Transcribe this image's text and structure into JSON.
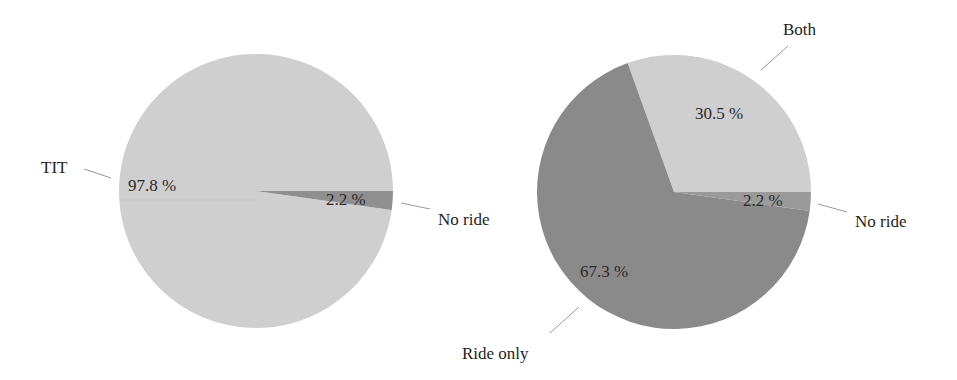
{
  "chart_data": [
    {
      "type": "pie",
      "title": "",
      "slices": [
        {
          "label": "TIT",
          "value": 97.8,
          "display": "97.8 %",
          "color": "#cfcfcf"
        },
        {
          "label": "No ride",
          "value": 2.2,
          "display": "2.2 %",
          "color": "#8f8f8f"
        }
      ],
      "legend": "none (direct labels with leader lines)"
    },
    {
      "type": "pie",
      "title": "",
      "slices": [
        {
          "label": "Both",
          "value": 30.5,
          "display": "30.5 %",
          "color": "#cfcfcf"
        },
        {
          "label": "No ride",
          "value": 2.2,
          "display": "2.2 %",
          "color": "#9a9a9a"
        },
        {
          "label": "Ride only",
          "value": 67.3,
          "display": "67.3 %",
          "color": "#8a8a8a"
        }
      ],
      "legend": "none (direct labels with leader lines)"
    }
  ],
  "left_pie": {
    "labels": {
      "tit": "TIT",
      "no_ride": "No ride"
    },
    "pcts": {
      "tit": "97.8 %",
      "no_ride": "2.2 %"
    }
  },
  "right_pie": {
    "labels": {
      "both": "Both",
      "no_ride": "No ride",
      "ride_only": "Ride only"
    },
    "pcts": {
      "both": "30.5 %",
      "no_ride": "2.2 %",
      "ride_only": "67.3 %"
    }
  }
}
